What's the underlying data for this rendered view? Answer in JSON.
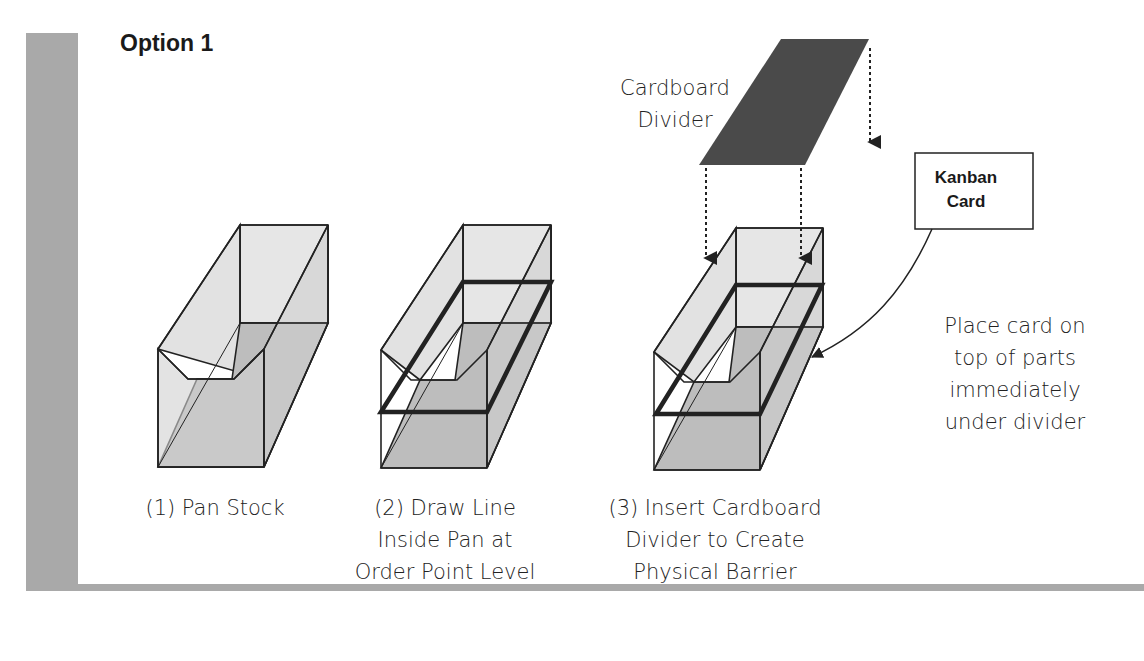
{
  "title": "Option 1",
  "divider_label": [
    "Cardboard",
    "Divider"
  ],
  "kanban_card_label": [
    "Kanban",
    "Card"
  ],
  "note": [
    "Place card on",
    "top of parts",
    "immediately",
    "under divider"
  ],
  "steps": [
    {
      "caption": [
        "(1) Pan Stock"
      ]
    },
    {
      "caption": [
        "(2) Draw Line",
        "Inside Pan at",
        "Order Point Level"
      ]
    },
    {
      "caption": [
        "(3) Insert Cardboard",
        "Divider to Create",
        "Physical Barrier"
      ]
    }
  ],
  "colors": {
    "frame": "#a9a9a9",
    "divider": "#4a4a4a",
    "pan_light": "#e6e6e6",
    "pan_dark": "#bdbdbd"
  }
}
